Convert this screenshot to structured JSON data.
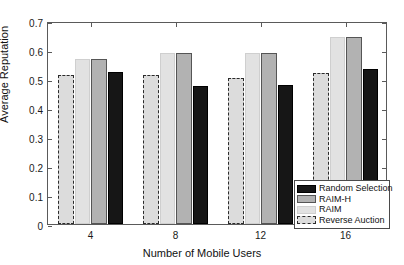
{
  "chart_data": {
    "type": "bar",
    "title": "",
    "xlabel": "Number of Mobile Users",
    "ylabel": "Average Reputation",
    "categories": [
      "4",
      "8",
      "12",
      "16"
    ],
    "ylim": [
      0,
      0.7
    ],
    "yticks": [
      "0",
      "0.1",
      "0.2",
      "0.3",
      "0.4",
      "0.5",
      "0.6",
      "0.7"
    ],
    "ytick_values": [
      0,
      0.1,
      0.2,
      0.3,
      0.4,
      0.5,
      0.6,
      0.7
    ],
    "grid": false,
    "legend_position": "bottom-right",
    "series": [
      {
        "name": "Reverse Auction",
        "values": [
          0.515,
          0.515,
          0.505,
          0.52
        ],
        "color": "#dcdcdc"
      },
      {
        "name": "RAIM",
        "values": [
          0.57,
          0.59,
          0.59,
          0.645
        ],
        "color": "#e2e2e2"
      },
      {
        "name": "RAIM-H",
        "values": [
          0.57,
          0.59,
          0.59,
          0.645
        ],
        "color": "#b2b2b2"
      },
      {
        "name": "Random Selection",
        "values": [
          0.525,
          0.475,
          0.48,
          0.535
        ],
        "color": "#161616"
      }
    ]
  },
  "legend": {
    "entries": [
      {
        "label": "Random Selection",
        "swatch": "#161616"
      },
      {
        "label": "RAIM-H",
        "swatch": "#b2b2b2"
      },
      {
        "label": "RAIM",
        "swatch": "#e2e2e2"
      },
      {
        "label": "Reverse Auction",
        "swatch": "#dcdcdc"
      }
    ]
  }
}
